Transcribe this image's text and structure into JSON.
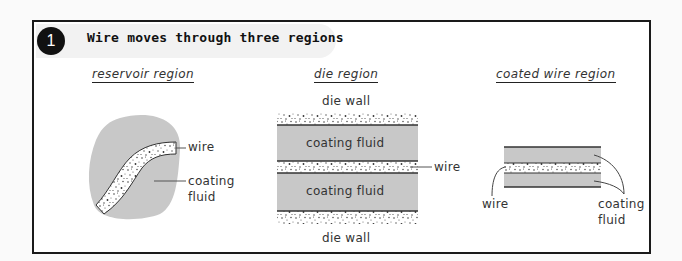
{
  "header": {
    "step_number": "1",
    "title": "Wire moves through three regions"
  },
  "regions": [
    {
      "id": "reservoir",
      "label": "reservoir region",
      "annotations": {
        "wire": "wire",
        "fluid_line1": "coating",
        "fluid_line2": "fluid"
      }
    },
    {
      "id": "die",
      "label": "die region",
      "annotations": {
        "top_wall": "die wall",
        "fluid_top": "coating fluid",
        "fluid_bottom": "coating fluid",
        "wire": "wire",
        "bottom_wall": "die wall"
      }
    },
    {
      "id": "coated",
      "label": "coated wire region",
      "annotations": {
        "wire": "wire",
        "fluid_line1": "coating",
        "fluid_line2": "fluid"
      }
    }
  ],
  "colors": {
    "fluid_gray": "#c8c8c8",
    "outline": "#333333",
    "badge": "#111111",
    "frame": "#1a1a1a"
  }
}
